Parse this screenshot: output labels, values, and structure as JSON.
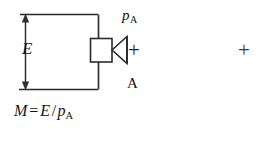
{
  "figure": {
    "background_color": "#ffffff",
    "line_color": "#2b2b2b",
    "text_color": "#141414"
  },
  "labels": {
    "dimension_E": "E",
    "pressure_symbol": "p",
    "pressure_subscript": "A",
    "area_label": "A",
    "plus_near_horn": "+",
    "plus_registration": "+"
  },
  "formula": {
    "lhs": "M",
    "equals": "=",
    "numerator": "E",
    "slash": "/",
    "denominator": "p",
    "denominator_subscript": "A",
    "full_text": "M = E / p_A"
  },
  "geometry": {
    "top_rule_y": 14,
    "bottom_rule_y": 89,
    "left_rule_x": 20,
    "right_rule_x": 98,
    "box_left": 90,
    "box_top": 38,
    "box_width": 22,
    "box_height": 24,
    "horn_apex_x": 112,
    "horn_mouth_x": 127,
    "arrow_x": 25
  }
}
